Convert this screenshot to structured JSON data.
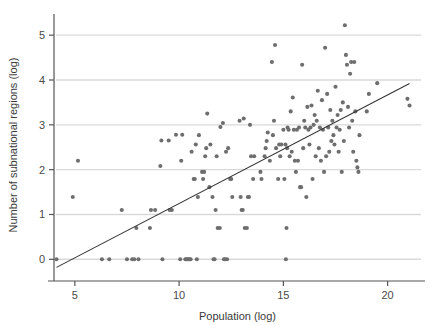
{
  "chart_data": {
    "type": "scatter",
    "title": "",
    "subtitle": "",
    "xlabel": "Population (log)",
    "ylabel": "Number of subnational regions (log)",
    "xlim": [
      4.0,
      21.6
    ],
    "ylim": [
      -0.35,
      5.45
    ],
    "xticks": [
      5,
      10,
      15,
      20
    ],
    "xtick_labels": [
      "5",
      "10",
      "15",
      "20"
    ],
    "yticks": [
      0,
      1,
      2,
      3,
      4,
      5
    ],
    "ytick_labels": [
      "0",
      "1",
      "2",
      "3",
      "4",
      "5"
    ],
    "grid": "horizontal",
    "grid_color": "#d9d9d9",
    "legend": "none",
    "marker_color": "#6e6e6e",
    "marker_size": 3.5,
    "axis_color": "#555555",
    "fit_line": {
      "name": "linear fit",
      "color": "#333333",
      "x": [
        4.12,
        21.05
      ],
      "y": [
        -0.18,
        3.92
      ],
      "slope": 0.2422,
      "intercept": -1.1777
    },
    "points": [
      [
        4.12,
        0.0
      ],
      [
        4.9,
        1.39
      ],
      [
        5.15,
        2.2
      ],
      [
        6.3,
        0.0
      ],
      [
        6.65,
        0.0
      ],
      [
        7.25,
        1.1
      ],
      [
        7.5,
        0.0
      ],
      [
        7.75,
        0.0
      ],
      [
        7.85,
        0.0
      ],
      [
        7.95,
        0.7
      ],
      [
        8.05,
        0.0
      ],
      [
        8.6,
        0.7
      ],
      [
        8.65,
        1.1
      ],
      [
        8.85,
        1.1
      ],
      [
        9.1,
        2.08
      ],
      [
        9.15,
        2.65
      ],
      [
        9.2,
        0.0
      ],
      [
        9.5,
        2.65
      ],
      [
        9.55,
        1.1
      ],
      [
        9.65,
        1.1
      ],
      [
        9.85,
        2.78
      ],
      [
        10.05,
        0.0
      ],
      [
        10.1,
        2.2
      ],
      [
        10.15,
        2.78
      ],
      [
        10.3,
        0.0
      ],
      [
        10.35,
        0.0
      ],
      [
        10.4,
        0.0
      ],
      [
        10.45,
        0.0
      ],
      [
        10.5,
        0.0
      ],
      [
        10.55,
        0.0
      ],
      [
        10.6,
        2.4
      ],
      [
        10.7,
        1.79
      ],
      [
        10.75,
        1.79
      ],
      [
        10.8,
        2.56
      ],
      [
        10.85,
        0.0
      ],
      [
        10.9,
        1.39
      ],
      [
        10.95,
        2.77
      ],
      [
        11.1,
        1.95
      ],
      [
        11.15,
        1.79
      ],
      [
        11.2,
        1.95
      ],
      [
        11.25,
        2.3
      ],
      [
        11.3,
        2.48
      ],
      [
        11.35,
        3.25
      ],
      [
        11.45,
        1.61
      ],
      [
        11.5,
        2.56
      ],
      [
        11.6,
        1.39
      ],
      [
        11.65,
        0.0
      ],
      [
        11.7,
        0.0
      ],
      [
        11.75,
        1.1
      ],
      [
        11.8,
        2.3
      ],
      [
        11.85,
        0.7
      ],
      [
        11.95,
        0.7
      ],
      [
        11.98,
        2.95
      ],
      [
        12.1,
        3.04
      ],
      [
        12.15,
        0.0
      ],
      [
        12.2,
        0.0
      ],
      [
        12.25,
        2.4
      ],
      [
        12.3,
        0.0
      ],
      [
        12.35,
        2.48
      ],
      [
        12.45,
        1.79
      ],
      [
        12.5,
        1.79
      ],
      [
        12.55,
        1.39
      ],
      [
        12.9,
        3.09
      ],
      [
        12.95,
        1.39
      ],
      [
        13.0,
        1.1
      ],
      [
        13.05,
        1.1
      ],
      [
        13.1,
        3.14
      ],
      [
        13.15,
        0.7
      ],
      [
        13.25,
        0.7
      ],
      [
        13.3,
        1.39
      ],
      [
        13.35,
        1.39
      ],
      [
        13.4,
        3.0
      ],
      [
        13.45,
        2.3
      ],
      [
        13.55,
        1.79
      ],
      [
        13.6,
        2.3
      ],
      [
        13.9,
        1.95
      ],
      [
        13.95,
        1.79
      ],
      [
        14.1,
        2.3
      ],
      [
        14.15,
        2.48
      ],
      [
        14.2,
        2.64
      ],
      [
        14.25,
        2.83
      ],
      [
        14.35,
        2.2
      ],
      [
        14.45,
        4.4
      ],
      [
        14.5,
        2.77
      ],
      [
        14.55,
        3.09
      ],
      [
        14.6,
        4.78
      ],
      [
        14.65,
        2.48
      ],
      [
        14.75,
        1.79
      ],
      [
        14.8,
        2.56
      ],
      [
        14.85,
        2.3
      ],
      [
        14.9,
        2.56
      ],
      [
        15.0,
        2.89
      ],
      [
        15.05,
        1.79
      ],
      [
        15.1,
        2.56
      ],
      [
        15.12,
        0.0
      ],
      [
        15.15,
        0.7
      ],
      [
        15.18,
        2.48
      ],
      [
        15.2,
        2.94
      ],
      [
        15.25,
        2.89
      ],
      [
        15.3,
        2.3
      ],
      [
        15.35,
        3.3
      ],
      [
        15.4,
        2.4
      ],
      [
        15.45,
        3.61
      ],
      [
        15.5,
        2.89
      ],
      [
        15.55,
        2.2
      ],
      [
        15.6,
        1.95
      ],
      [
        15.65,
        2.89
      ],
      [
        15.7,
        2.2
      ],
      [
        15.75,
        2.94
      ],
      [
        15.8,
        1.61
      ],
      [
        15.85,
        1.61
      ],
      [
        15.9,
        4.34
      ],
      [
        15.95,
        2.48
      ],
      [
        16.0,
        3.09
      ],
      [
        16.05,
        2.94
      ],
      [
        16.1,
        1.39
      ],
      [
        16.15,
        3.4
      ],
      [
        16.2,
        2.89
      ],
      [
        16.25,
        2.56
      ],
      [
        16.3,
        2.94
      ],
      [
        16.35,
        3.43
      ],
      [
        16.4,
        1.79
      ],
      [
        16.45,
        3.0
      ],
      [
        16.5,
        3.22
      ],
      [
        16.55,
        2.3
      ],
      [
        16.6,
        3.09
      ],
      [
        16.65,
        3.76
      ],
      [
        16.7,
        2.48
      ],
      [
        16.75,
        2.94
      ],
      [
        16.8,
        2.2
      ],
      [
        16.85,
        3.55
      ],
      [
        16.9,
        2.89
      ],
      [
        16.95,
        1.95
      ],
      [
        17.0,
        4.72
      ],
      [
        17.05,
        2.3
      ],
      [
        17.1,
        3.69
      ],
      [
        17.15,
        2.94
      ],
      [
        17.2,
        2.4
      ],
      [
        17.25,
        3.33
      ],
      [
        17.3,
        2.64
      ],
      [
        17.35,
        3.09
      ],
      [
        17.4,
        2.77
      ],
      [
        17.45,
        2.56
      ],
      [
        17.5,
        3.85
      ],
      [
        17.55,
        2.94
      ],
      [
        17.6,
        3.22
      ],
      [
        17.65,
        2.4
      ],
      [
        17.7,
        2.89
      ],
      [
        17.75,
        3.33
      ],
      [
        17.8,
        1.95
      ],
      [
        17.85,
        3.5
      ],
      [
        17.9,
        2.64
      ],
      [
        17.95,
        5.22
      ],
      [
        18.0,
        4.56
      ],
      [
        18.05,
        4.34
      ],
      [
        18.1,
        3.4
      ],
      [
        18.15,
        2.94
      ],
      [
        18.2,
        4.14
      ],
      [
        18.25,
        4.4
      ],
      [
        18.3,
        3.09
      ],
      [
        18.35,
        2.4
      ],
      [
        18.4,
        4.4
      ],
      [
        18.45,
        3.3
      ],
      [
        18.5,
        2.2
      ],
      [
        18.55,
        2.05
      ],
      [
        18.6,
        1.95
      ],
      [
        18.65,
        2.77
      ],
      [
        19.0,
        3.3
      ],
      [
        19.1,
        3.69
      ],
      [
        19.5,
        3.93
      ],
      [
        20.95,
        3.58
      ],
      [
        21.05,
        3.43
      ]
    ]
  },
  "figure": {
    "background_color": "#ffffff",
    "width": 433,
    "height": 325
  }
}
